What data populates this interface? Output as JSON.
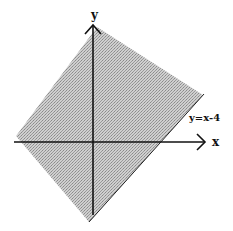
{
  "diagram": {
    "axes": {
      "x_label": "x",
      "y_label": "y"
    },
    "line": {
      "label": "y=x-4",
      "equation": "y = x - 4"
    },
    "region": {
      "description": "shaded region on the upper-left side of the line y=x-4 (y > x - 4)",
      "fill_color": "#b8b8b8",
      "pattern": "halftone dots"
    },
    "colors": {
      "axis": "#111111",
      "boundary": "#222222",
      "background": "#ffffff"
    }
  }
}
